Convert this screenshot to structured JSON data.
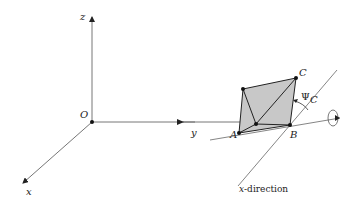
{
  "diagram": {
    "axes": {
      "z_label": "z",
      "x_label": "x",
      "y_label": "y",
      "origin_label": "O"
    },
    "tetrahedron": {
      "vertex_a_label": "A",
      "vertex_b_label": "B",
      "vertex_c_label": "C",
      "fill_color": "#c8c8c8"
    },
    "angle_label": "Ψ",
    "angle_subscript": "C",
    "direction_caption": "x-direction",
    "direction_caption_italic": "x",
    "direction_caption_rest": "-direction",
    "line_color": "#555555"
  }
}
